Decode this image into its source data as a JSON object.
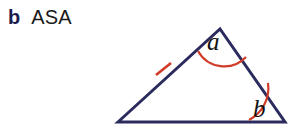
{
  "figure": {
    "label": "b",
    "title": "ASA",
    "colors": {
      "label_navy": "#1c1c4e",
      "title_black": "#1a1a1a",
      "triangle_stroke": "#2b2b5e",
      "mark_red": "#d13b28",
      "background": "#ffffff"
    },
    "triangle": {
      "name": "asa-triangle",
      "vertices": {
        "left": {
          "x": 118,
          "y": 122
        },
        "apex": {
          "x": 220,
          "y": 29
        },
        "right": {
          "x": 285,
          "y": 122
        }
      },
      "stroke_width": 3
    },
    "side_tick": {
      "name": "congruent-side-tick",
      "on_side": "left",
      "center": {
        "x": 163,
        "y": 69
      },
      "x1": 156,
      "y1": 75,
      "x2": 171,
      "y2": 63,
      "count": 1
    },
    "angles": [
      {
        "name": "angle-a",
        "label": "a",
        "at_vertex": "apex",
        "arc_path": "M 198 51 A 30 30 0 0 0 246 57",
        "label_x": 207,
        "label_y": 50
      },
      {
        "name": "angle-b",
        "label": "b",
        "at_vertex": "right",
        "arc_path": "M 249 120 A 36 36 0 0 0 268 83",
        "label_x": 253,
        "label_y": 117
      }
    ]
  }
}
